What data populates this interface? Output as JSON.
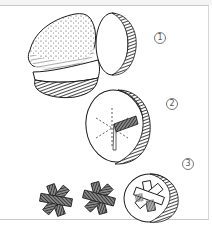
{
  "figure": {
    "steps": [
      {
        "number": "1",
        "glyph": "①",
        "caption": "potato halved and sliced"
      },
      {
        "number": "2",
        "glyph": "②",
        "caption": "slice with asterisk shape being carved"
      },
      {
        "number": "3",
        "glyph": "③",
        "caption": "carved asterisk stamps"
      }
    ]
  },
  "colors": {
    "ink": "#1a1a1a",
    "shade": "#3a3a3a",
    "paper": "#ffffff",
    "frame": "#c8c8c8",
    "label": "#555555"
  }
}
